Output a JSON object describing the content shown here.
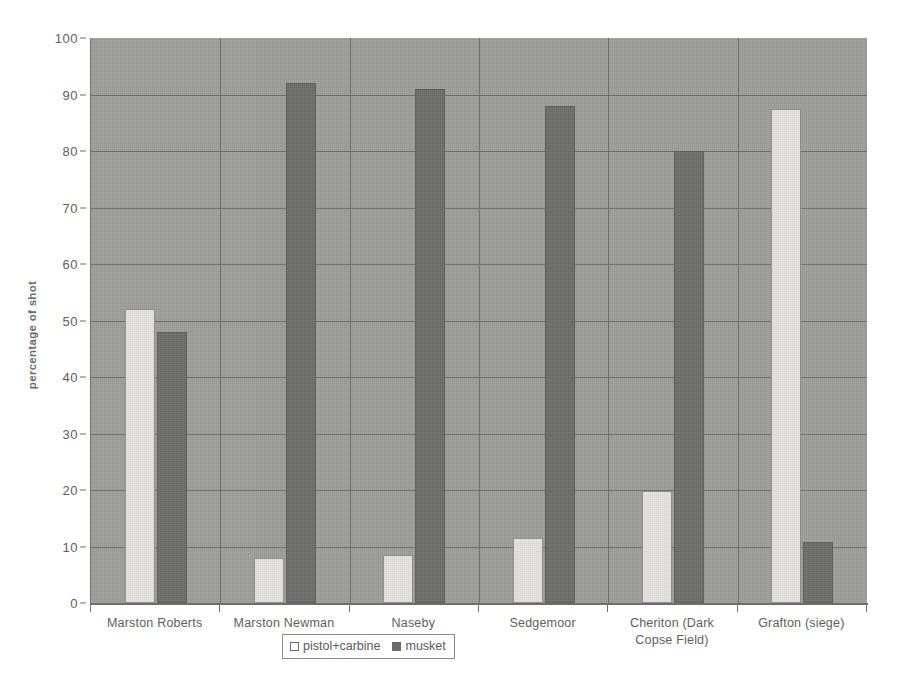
{
  "chart_data": {
    "type": "bar",
    "title": "",
    "subtitle": "",
    "xlabel": "",
    "ylabel": "percentage of shot",
    "ylim": [
      0,
      100
    ],
    "ytick_step": 10,
    "yticks": [
      "0",
      "10",
      "20",
      "30",
      "40",
      "50",
      "60",
      "70",
      "80",
      "90",
      "100"
    ],
    "grid": true,
    "legend_position": "below-axis-center",
    "categories": [
      "Marston Roberts",
      "Marston Newman",
      "Naseby",
      "Sedgemoor",
      "Cheriton (Dark Copse Field)",
      "Grafton (siege)"
    ],
    "category_lines": [
      [
        "Marston Roberts"
      ],
      [
        "Marston Newman"
      ],
      [
        "Naseby"
      ],
      [
        "Sedgemoor"
      ],
      [
        "Cheriton (Dark",
        "Copse Field)"
      ],
      [
        "Grafton (siege)"
      ]
    ],
    "series": [
      {
        "name": "pistol+carbine",
        "color": "#e4e3e0",
        "values": [
          52,
          8,
          8.5,
          11.5,
          19.8,
          87.5
        ]
      },
      {
        "name": "musket",
        "color": "#6c6c6a",
        "values": [
          48,
          92,
          91,
          88,
          80,
          10.8
        ]
      }
    ]
  },
  "legend": {
    "items": [
      {
        "label": "pistol+carbine",
        "swatch": "open-square-marker"
      },
      {
        "label": "musket",
        "swatch": "filled-square-marker"
      }
    ]
  },
  "colors": {
    "plot_background": "#9d9d9b",
    "gridline": "#6d6d6d",
    "axis": "#6d6d6d",
    "text": "#5e5e5e",
    "series_light": "#e4e3e0",
    "series_dark": "#6c6c6a",
    "page_background": "#ffffff"
  }
}
